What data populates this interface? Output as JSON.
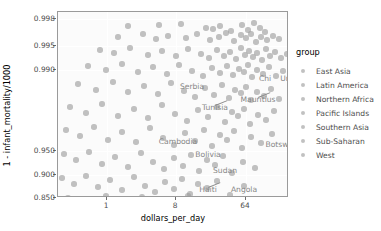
{
  "chart_data": {
    "type": "scatter",
    "title": "",
    "xlabel": "dollars_per_day",
    "ylabel": "1 - infant_mortality/1000",
    "x_scale": "log2",
    "y_scale": "logit",
    "xticks": [
      "1",
      "8",
      "64"
    ],
    "xtick_values": [
      1,
      8,
      64
    ],
    "yticks": [
      "0.998",
      "0.995",
      "0.990",
      "0.950",
      "0.900",
      "0.850"
    ],
    "ytick_values": [
      0.998,
      0.995,
      0.99,
      0.95,
      0.9,
      0.85
    ],
    "grid": true,
    "legend_position": "right",
    "point_color": "#9b9b9b",
    "panel_background": "#fbfbfb",
    "annotations": [
      {
        "text": "Singapore",
        "px": 250,
        "py": 18,
        "leader": false
      },
      {
        "text": "Sweden",
        "px": 252,
        "py": 38,
        "leader": false
      },
      {
        "text": "United States",
        "px": 248,
        "py": 67,
        "leader": false
      },
      {
        "text": "Chi",
        "px": 207,
        "py": 67,
        "leader": false
      },
      {
        "text": "Serbia",
        "px": 134,
        "py": 75,
        "leader": false
      },
      {
        "text": "Mauritius",
        "px": 200,
        "py": 88,
        "leader": true
      },
      {
        "text": "Tunisia",
        "px": 157,
        "py": 96,
        "leader": true
      },
      {
        "text": "Botswana",
        "px": 226,
        "py": 133,
        "leader": false
      },
      {
        "text": "Cambodia",
        "px": 120,
        "py": 130,
        "leader": false
      },
      {
        "text": "Bolivia",
        "px": 150,
        "py": 143,
        "leader": false
      },
      {
        "text": "Sudan",
        "px": 167,
        "py": 159,
        "leader": false
      },
      {
        "text": "Haiti",
        "px": 150,
        "py": 178,
        "leader": true
      },
      {
        "text": "Angola",
        "px": 186,
        "py": 178,
        "leader": false
      },
      {
        "text": "Sierra Leone",
        "px": 94,
        "py": 190,
        "leader": false
      }
    ],
    "points": [
      {
        "x": 70,
        "y": 14
      },
      {
        "x": 101,
        "y": 13
      },
      {
        "x": 123,
        "y": 12
      },
      {
        "x": 148,
        "y": 16
      },
      {
        "x": 155,
        "y": 17
      },
      {
        "x": 162,
        "y": 14
      },
      {
        "x": 173,
        "y": 19
      },
      {
        "x": 184,
        "y": 13
      },
      {
        "x": 190,
        "y": 18
      },
      {
        "x": 196,
        "y": 11
      },
      {
        "x": 202,
        "y": 16
      },
      {
        "x": 207,
        "y": 20
      },
      {
        "x": 60,
        "y": 25
      },
      {
        "x": 85,
        "y": 22
      },
      {
        "x": 98,
        "y": 27
      },
      {
        "x": 110,
        "y": 24
      },
      {
        "x": 128,
        "y": 26
      },
      {
        "x": 139,
        "y": 22
      },
      {
        "x": 152,
        "y": 28
      },
      {
        "x": 161,
        "y": 25
      },
      {
        "x": 168,
        "y": 21
      },
      {
        "x": 176,
        "y": 29
      },
      {
        "x": 183,
        "y": 23
      },
      {
        "x": 188,
        "y": 26
      },
      {
        "x": 193,
        "y": 22
      },
      {
        "x": 198,
        "y": 30
      },
      {
        "x": 203,
        "y": 25
      },
      {
        "x": 209,
        "y": 28
      },
      {
        "x": 215,
        "y": 24
      },
      {
        "x": 221,
        "y": 27
      },
      {
        "x": 42,
        "y": 38
      },
      {
        "x": 56,
        "y": 41
      },
      {
        "x": 72,
        "y": 36
      },
      {
        "x": 90,
        "y": 43
      },
      {
        "x": 104,
        "y": 39
      },
      {
        "x": 118,
        "y": 44
      },
      {
        "x": 130,
        "y": 37
      },
      {
        "x": 143,
        "y": 42
      },
      {
        "x": 151,
        "y": 46
      },
      {
        "x": 159,
        "y": 38
      },
      {
        "x": 166,
        "y": 44
      },
      {
        "x": 172,
        "y": 40
      },
      {
        "x": 178,
        "y": 47
      },
      {
        "x": 183,
        "y": 36
      },
      {
        "x": 187,
        "y": 43
      },
      {
        "x": 191,
        "y": 39
      },
      {
        "x": 195,
        "y": 45
      },
      {
        "x": 199,
        "y": 41
      },
      {
        "x": 204,
        "y": 48
      },
      {
        "x": 208,
        "y": 37
      },
      {
        "x": 212,
        "y": 44
      },
      {
        "x": 217,
        "y": 40
      },
      {
        "x": 223,
        "y": 46
      },
      {
        "x": 229,
        "y": 42
      },
      {
        "x": 30,
        "y": 54
      },
      {
        "x": 48,
        "y": 58
      },
      {
        "x": 64,
        "y": 52
      },
      {
        "x": 80,
        "y": 60
      },
      {
        "x": 95,
        "y": 55
      },
      {
        "x": 109,
        "y": 62
      },
      {
        "x": 121,
        "y": 53
      },
      {
        "x": 134,
        "y": 59
      },
      {
        "x": 145,
        "y": 64
      },
      {
        "x": 154,
        "y": 56
      },
      {
        "x": 162,
        "y": 61
      },
      {
        "x": 169,
        "y": 54
      },
      {
        "x": 175,
        "y": 63
      },
      {
        "x": 181,
        "y": 57
      },
      {
        "x": 186,
        "y": 60
      },
      {
        "x": 190,
        "y": 53
      },
      {
        "x": 194,
        "y": 65
      },
      {
        "x": 199,
        "y": 58
      },
      {
        "x": 205,
        "y": 62
      },
      {
        "x": 211,
        "y": 55
      },
      {
        "x": 218,
        "y": 64
      },
      {
        "x": 225,
        "y": 59
      },
      {
        "x": 20,
        "y": 72
      },
      {
        "x": 38,
        "y": 78
      },
      {
        "x": 55,
        "y": 70
      },
      {
        "x": 70,
        "y": 80
      },
      {
        "x": 86,
        "y": 74
      },
      {
        "x": 100,
        "y": 82
      },
      {
        "x": 113,
        "y": 71
      },
      {
        "x": 126,
        "y": 79
      },
      {
        "x": 137,
        "y": 85
      },
      {
        "x": 147,
        "y": 76
      },
      {
        "x": 156,
        "y": 83
      },
      {
        "x": 164,
        "y": 73
      },
      {
        "x": 171,
        "y": 86
      },
      {
        "x": 177,
        "y": 78
      },
      {
        "x": 183,
        "y": 81
      },
      {
        "x": 188,
        "y": 75
      },
      {
        "x": 193,
        "y": 88
      },
      {
        "x": 199,
        "y": 80
      },
      {
        "x": 206,
        "y": 84
      },
      {
        "x": 213,
        "y": 77
      },
      {
        "x": 221,
        "y": 87
      },
      {
        "x": 12,
        "y": 95
      },
      {
        "x": 28,
        "y": 101
      },
      {
        "x": 44,
        "y": 92
      },
      {
        "x": 60,
        "y": 104
      },
      {
        "x": 76,
        "y": 97
      },
      {
        "x": 90,
        "y": 106
      },
      {
        "x": 104,
        "y": 93
      },
      {
        "x": 117,
        "y": 102
      },
      {
        "x": 129,
        "y": 109
      },
      {
        "x": 140,
        "y": 98
      },
      {
        "x": 150,
        "y": 105
      },
      {
        "x": 159,
        "y": 95
      },
      {
        "x": 167,
        "y": 110
      },
      {
        "x": 174,
        "y": 100
      },
      {
        "x": 180,
        "y": 104
      },
      {
        "x": 186,
        "y": 97
      },
      {
        "x": 192,
        "y": 112
      },
      {
        "x": 200,
        "y": 103
      },
      {
        "x": 208,
        "y": 108
      },
      {
        "x": 216,
        "y": 99
      },
      {
        "x": 8,
        "y": 118
      },
      {
        "x": 22,
        "y": 124
      },
      {
        "x": 36,
        "y": 115
      },
      {
        "x": 50,
        "y": 128
      },
      {
        "x": 64,
        "y": 120
      },
      {
        "x": 78,
        "y": 130
      },
      {
        "x": 92,
        "y": 116
      },
      {
        "x": 105,
        "y": 126
      },
      {
        "x": 116,
        "y": 133
      },
      {
        "x": 127,
        "y": 121
      },
      {
        "x": 137,
        "y": 129
      },
      {
        "x": 146,
        "y": 118
      },
      {
        "x": 154,
        "y": 134
      },
      {
        "x": 162,
        "y": 123
      },
      {
        "x": 169,
        "y": 128
      },
      {
        "x": 176,
        "y": 119
      },
      {
        "x": 184,
        "y": 136
      },
      {
        "x": 193,
        "y": 125
      },
      {
        "x": 203,
        "y": 131
      },
      {
        "x": 214,
        "y": 122
      },
      {
        "x": 6,
        "y": 142
      },
      {
        "x": 18,
        "y": 148
      },
      {
        "x": 31,
        "y": 140
      },
      {
        "x": 44,
        "y": 152
      },
      {
        "x": 57,
        "y": 145
      },
      {
        "x": 70,
        "y": 155
      },
      {
        "x": 83,
        "y": 141
      },
      {
        "x": 95,
        "y": 150
      },
      {
        "x": 106,
        "y": 157
      },
      {
        "x": 116,
        "y": 146
      },
      {
        "x": 125,
        "y": 154
      },
      {
        "x": 133,
        "y": 143
      },
      {
        "x": 141,
        "y": 159
      },
      {
        "x": 149,
        "y": 148
      },
      {
        "x": 157,
        "y": 153
      },
      {
        "x": 165,
        "y": 144
      },
      {
        "x": 174,
        "y": 161
      },
      {
        "x": 185,
        "y": 150
      },
      {
        "x": 197,
        "y": 156
      },
      {
        "x": 4,
        "y": 166
      },
      {
        "x": 16,
        "y": 172
      },
      {
        "x": 28,
        "y": 164
      },
      {
        "x": 40,
        "y": 175
      },
      {
        "x": 52,
        "y": 168
      },
      {
        "x": 64,
        "y": 178
      },
      {
        "x": 76,
        "y": 165
      },
      {
        "x": 87,
        "y": 174
      },
      {
        "x": 97,
        "y": 180
      },
      {
        "x": 107,
        "y": 170
      },
      {
        "x": 116,
        "y": 177
      },
      {
        "x": 124,
        "y": 167
      },
      {
        "x": 132,
        "y": 182
      },
      {
        "x": 140,
        "y": 172
      },
      {
        "x": 149,
        "y": 176
      },
      {
        "x": 159,
        "y": 169
      },
      {
        "x": 172,
        "y": 183
      },
      {
        "x": 186,
        "y": 174
      },
      {
        "x": 10,
        "y": 186
      },
      {
        "x": 30,
        "y": 190
      },
      {
        "x": 48,
        "y": 184
      },
      {
        "x": 66,
        "y": 188
      },
      {
        "x": 84,
        "y": 185
      },
      {
        "x": 100,
        "y": 189
      },
      {
        "x": 114,
        "y": 187
      },
      {
        "x": 130,
        "y": 184
      },
      {
        "x": 143,
        "y": 188
      }
    ]
  },
  "legend": {
    "title": "group",
    "items": [
      {
        "label": "East Asia"
      },
      {
        "label": "Latin America"
      },
      {
        "label": "Northern Africa"
      },
      {
        "label": "Pacific Islands"
      },
      {
        "label": "Southern Asia"
      },
      {
        "label": "Sub-Saharan"
      },
      {
        "label": "West"
      }
    ]
  }
}
